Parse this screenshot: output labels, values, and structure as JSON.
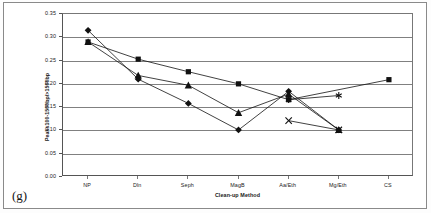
{
  "panel_tag": "(g)",
  "chart_data": {
    "type": "line",
    "title": "",
    "xlabel": "Clean-up Method",
    "ylabel": "Peaks100-1500bp/>1500bp",
    "categories": [
      "NP",
      "Dln",
      "Seph",
      "MagB",
      "Aa/Eth",
      "Mg/Eth",
      "CS"
    ],
    "ylim": [
      0.0,
      0.35
    ],
    "ytick_values": [
      0.0,
      0.05,
      0.1,
      0.15,
      0.2,
      0.25,
      0.3,
      0.35
    ],
    "ytick_labels": [
      "0.00",
      "0.05",
      "0.10",
      "0.15",
      "0.20",
      "0.25",
      "0.30",
      "0.35"
    ],
    "grid": "horizontal",
    "legend": "none",
    "series": [
      {
        "name": "Series 1",
        "marker": "diamond",
        "x": [
          "NP",
          "Dln",
          "Seph",
          "MagB",
          "Aa/Eth",
          "Mg/Eth"
        ],
        "values": [
          0.315,
          0.21,
          0.158,
          0.101,
          0.184,
          0.101
        ]
      },
      {
        "name": "Series 2",
        "marker": "square",
        "x": [
          "NP",
          "Dln",
          "Seph",
          "MagB",
          "Aa/Eth",
          "Mg/Eth",
          "CS"
        ],
        "values": [
          0.29,
          0.253,
          0.226,
          0.2,
          0.166,
          null,
          0.209
        ]
      },
      {
        "name": "Series 3",
        "marker": "triangle",
        "x": [
          "NP",
          "Dln",
          "Seph",
          "MagB",
          "Aa/Eth",
          "Mg/Eth"
        ],
        "values": [
          0.29,
          0.218,
          0.197,
          0.138,
          0.178,
          0.101
        ]
      },
      {
        "name": "Series 4",
        "marker": "cross",
        "x": [
          "Aa/Eth",
          "Mg/Eth"
        ],
        "values": [
          0.121,
          0.101
        ]
      },
      {
        "name": "Series 5",
        "marker": "star",
        "x": [
          "Aa/Eth",
          "Mg/Eth"
        ],
        "values": [
          0.166,
          0.175
        ]
      }
    ]
  }
}
